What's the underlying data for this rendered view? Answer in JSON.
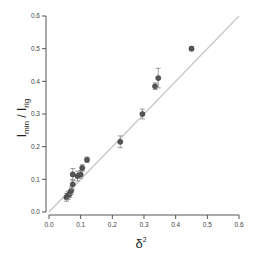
{
  "chart_data": {
    "type": "scatter",
    "title": "",
    "xlabel": "δ²",
    "ylabel": "I_min / I_rig",
    "xlim": [
      0.0,
      0.6
    ],
    "ylim": [
      0.0,
      0.6
    ],
    "xticks": [
      "0.0",
      "0.1",
      "0.2",
      "0.3",
      "0.4",
      "0.5",
      "0.6"
    ],
    "yticks": [
      "0.0",
      "0.1",
      "0.2",
      "0.3",
      "0.4",
      "0.5",
      "0.6"
    ],
    "grid": false,
    "legend": null,
    "reference_line": {
      "label": "y = x",
      "x": [
        0.0,
        0.6
      ],
      "y": [
        0.0,
        0.6
      ],
      "color": "#c8c8c8"
    },
    "series": [
      {
        "name": "data",
        "marker_color": "#555555",
        "points": [
          {
            "x": 0.055,
            "y": 0.045,
            "err": 0.012
          },
          {
            "x": 0.06,
            "y": 0.05,
            "err": 0.012
          },
          {
            "x": 0.065,
            "y": 0.055,
            "err": 0.01
          },
          {
            "x": 0.07,
            "y": 0.065,
            "err": 0.012
          },
          {
            "x": 0.075,
            "y": 0.085,
            "err": 0.015
          },
          {
            "x": 0.075,
            "y": 0.115,
            "err": 0.018
          },
          {
            "x": 0.09,
            "y": 0.11,
            "err": 0.015
          },
          {
            "x": 0.1,
            "y": 0.115,
            "err": 0.012
          },
          {
            "x": 0.105,
            "y": 0.135,
            "err": 0.01
          },
          {
            "x": 0.12,
            "y": 0.16,
            "err": 0.008
          },
          {
            "x": 0.225,
            "y": 0.215,
            "err": 0.018
          },
          {
            "x": 0.295,
            "y": 0.3,
            "err": 0.015
          },
          {
            "x": 0.335,
            "y": 0.385,
            "err": 0.01
          },
          {
            "x": 0.345,
            "y": 0.41,
            "err": 0.03
          },
          {
            "x": 0.45,
            "y": 0.5,
            "err": 0.006
          }
        ]
      }
    ]
  }
}
